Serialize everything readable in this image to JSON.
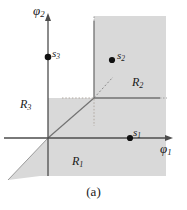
{
  "figure": {
    "caption": "(a)",
    "background_color": "#ffffff",
    "shaded_region_color": "#d9d9d9",
    "axis_color": "#4d4d4d",
    "boundary_color": "#808080",
    "point_color": "#111111",
    "text_color": "#1a1a1a"
  },
  "axes": {
    "x_label": "φ",
    "x_label_sub": "1",
    "y_label": "φ",
    "y_label_sub": "2",
    "origin": {
      "x": 48,
      "y": 138
    },
    "x_axis": {
      "from_x": 4,
      "to_x": 172,
      "y": 138,
      "arrow": "right"
    },
    "y_axis": {
      "x": 48,
      "from_y": 176,
      "to_y": 14,
      "arrow": "up"
    }
  },
  "points": [
    {
      "name": "s1",
      "label": "s",
      "sub": "1",
      "x": 130,
      "y": 138
    },
    {
      "name": "s2",
      "label": "s",
      "sub": "2",
      "x": 112,
      "y": 60
    },
    {
      "name": "s3",
      "label": "s",
      "sub": "3",
      "x": 48,
      "y": 57
    }
  ],
  "regions": [
    {
      "name": "R1",
      "label": "R",
      "sub": "1",
      "x": 78,
      "y": 162
    },
    {
      "name": "R2",
      "label": "R",
      "sub": "2",
      "x": 139,
      "y": 82
    },
    {
      "name": "R3",
      "label": "R",
      "sub": "3",
      "x": 27,
      "y": 104
    }
  ],
  "boundaries": {
    "junction": {
      "x": 94,
      "y": 98
    },
    "vertical_solid": {
      "x": 94,
      "from_y": 98,
      "to_y": 20
    },
    "horizontal_solid": {
      "y": 98,
      "from_x": 94,
      "to_x": 160
    },
    "diagonal_solid": {
      "from_x": 48,
      "from_y": 138,
      "to_x": 94,
      "to_y": 98
    },
    "diagonal_dashed_ext": {
      "from_x": 94,
      "from_y": 98,
      "to_x": 113,
      "to_y": 77
    },
    "diagonal_lower_ext": {
      "from_x": 48,
      "from_y": 138,
      "to_x": 8,
      "to_y": 180
    },
    "dotted_horizontal": {
      "y": 98,
      "from_x": 62,
      "to_x": 94
    },
    "dotted_vertical": {
      "x": 94,
      "from_y": 98,
      "to_y": 126
    },
    "dotted_top": {
      "x": 94,
      "from_y": 16,
      "to_y": 22
    },
    "dotted_right": {
      "y": 98,
      "from_x": 160,
      "to_x": 166
    }
  },
  "shaded_area": {
    "top": 16,
    "right": 166,
    "bottom": 176,
    "description": "union of R1 and R2 shaded quadrant"
  }
}
